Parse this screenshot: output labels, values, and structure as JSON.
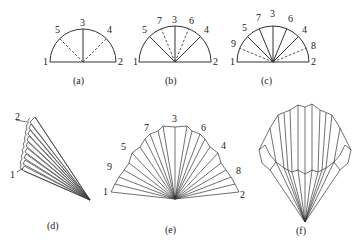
{
  "figure": {
    "panels": [
      {
        "id": "a",
        "caption": "(a)",
        "type": "semicircle",
        "point_labels": [
          "1",
          "2",
          "3",
          "4",
          "5"
        ],
        "solid_lines": [
          "3"
        ],
        "dashed_lines": [
          "4",
          "5"
        ]
      },
      {
        "id": "b",
        "caption": "(b)",
        "type": "semicircle",
        "point_labels": [
          "1",
          "2",
          "3",
          "4",
          "5",
          "6",
          "7"
        ],
        "solid_lines": [
          "3",
          "4",
          "5"
        ],
        "dashed_lines": [
          "6",
          "7"
        ]
      },
      {
        "id": "c",
        "caption": "(c)",
        "type": "semicircle",
        "point_labels": [
          "1",
          "2",
          "3",
          "4",
          "5",
          "6",
          "7",
          "8",
          "9"
        ],
        "solid_lines": [
          "3",
          "4",
          "5",
          "6",
          "7"
        ],
        "dashed_lines": [
          "8",
          "9"
        ]
      },
      {
        "id": "d",
        "caption": "(d)",
        "type": "folded-stack",
        "point_labels": [
          "2",
          "1"
        ]
      },
      {
        "id": "e",
        "caption": "(e)",
        "type": "pleated-fan",
        "point_labels": [
          "1",
          "9",
          "5",
          "7",
          "3",
          "6",
          "4",
          "8",
          "2"
        ]
      },
      {
        "id": "f",
        "caption": "(f)",
        "type": "pleated-cone",
        "point_labels": []
      }
    ]
  }
}
